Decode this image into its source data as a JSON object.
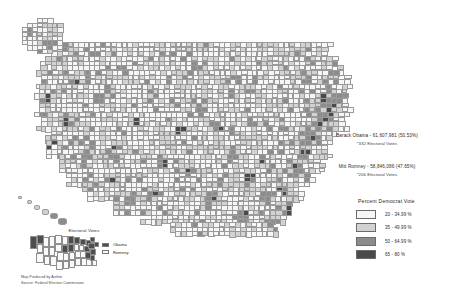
{
  "map": {
    "title": "2012 United States Presidential Election — County Level Results",
    "projection_note": "Conterminous United States with Alaska and Hawaii insets"
  },
  "results": {
    "democrat": {
      "candidate_line": "Barack Obama - 61,607,981 (50.53%)",
      "electoral_line": "*332 Electoral Votes",
      "name": "Obama",
      "popular_votes": "61,607,981",
      "popular_pct": "50.53%",
      "electoral_votes": "332"
    },
    "republican": {
      "candidate_line": "Mitt Romney - 58,846,086 (47.65%)",
      "electoral_line": "*206 Electoral Votes",
      "name": "Romney",
      "popular_votes": "58,846,086",
      "popular_pct": "47.65%",
      "electoral_votes": "206"
    }
  },
  "legend": {
    "title": "Percent Democrat Vote",
    "classes": [
      {
        "label": "20 - 34.99 %",
        "color": "#f6f6f6"
      },
      {
        "label": "35 - 49.99 %",
        "color": "#d2d2d2"
      },
      {
        "label": "50 - 64.99 %",
        "color": "#8c8c8c"
      },
      {
        "label": "65 - 80 %",
        "color": "#4a4a4a"
      }
    ]
  },
  "electoral_inset": {
    "title": "Electoral Votes",
    "keys": [
      {
        "label": "Obama",
        "color": "#4d4d4d"
      },
      {
        "label": "Romney",
        "color": "#fafafa"
      }
    ]
  },
  "credit": {
    "line1": "Map Produced by Author",
    "line2": "Source: Federal Election Commission"
  },
  "chart_data": {
    "type": "choropleth",
    "title": "Percent Democrat Vote",
    "unit": "percent",
    "classification": "graduated color, 4 classes",
    "breaks": [
      20,
      35,
      50,
      65,
      80
    ],
    "class_labels": [
      "20 - 34.99 %",
      "35 - 49.99 %",
      "50 - 64.99 %",
      "65 - 80 %"
    ],
    "class_colors": [
      "#f6f6f6",
      "#d2d2d2",
      "#8c8c8c",
      "#4a4a4a"
    ],
    "series": [
      {
        "name": "Barack Obama",
        "popular_votes": 61607981,
        "popular_pct": 50.53,
        "electoral_votes": 332
      },
      {
        "name": "Mitt Romney",
        "popular_votes": 58846086,
        "popular_pct": 47.65,
        "electoral_votes": 206
      }
    ]
  }
}
